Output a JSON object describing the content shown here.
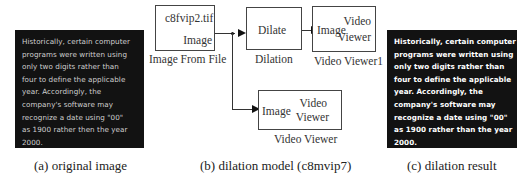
{
  "panels": {
    "a": {
      "caption": "(a)  original image",
      "text_lines": [
        "Historically, certain computer",
        "programs were written using",
        "only two digits rather than",
        "four to define the applicable",
        "year. Accordingly, the",
        "company's software may",
        "recognize a date using \"00\"",
        "as 1900 rather then the year",
        "2000."
      ]
    },
    "b": {
      "caption": "(b)  dilation model (c8mvip7)",
      "blocks": {
        "file": {
          "title": "c8fvip2.tif",
          "port": "Image",
          "label": "Image From File"
        },
        "dilate": {
          "title": "Dilate",
          "label": "Dilation"
        },
        "viewer1": {
          "port": "Image",
          "title_line1": "Video",
          "title_line2": "Viewer",
          "label": "Video Viewer1"
        },
        "viewer": {
          "port": "Image",
          "title_line1": "Video",
          "title_line2": "Viewer",
          "label": "Video Viewer"
        }
      }
    },
    "c": {
      "caption": "(c)  dilation result",
      "text_lines": [
        "Historically, certain computer",
        "programs were written using",
        "only two digits rather than",
        "four to define the applicable",
        "year. Accordingly, the",
        "company's software may",
        "recognize a date using \"00\"",
        "as 1900 rather than the year",
        "2000."
      ]
    }
  }
}
